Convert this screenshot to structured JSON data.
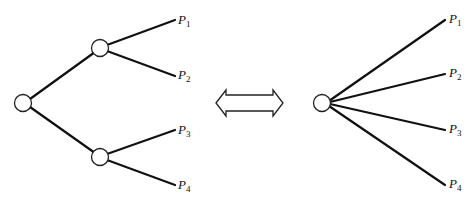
{
  "diagram": {
    "left_tree": {
      "description": "binary tree with two levels",
      "leaves": [
        {
          "label": "P",
          "sub": "1"
        },
        {
          "label": "P",
          "sub": "2"
        },
        {
          "label": "P",
          "sub": "3"
        },
        {
          "label": "P",
          "sub": "4"
        }
      ]
    },
    "equivalence_arrow": "double-headed-arrow",
    "right_tree": {
      "description": "single node with four branches",
      "leaves": [
        {
          "label": "P",
          "sub": "1"
        },
        {
          "label": "P",
          "sub": "2"
        },
        {
          "label": "P",
          "sub": "3"
        },
        {
          "label": "P",
          "sub": "4"
        }
      ]
    }
  }
}
